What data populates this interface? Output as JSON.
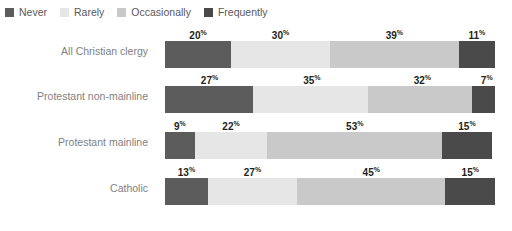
{
  "legend": {
    "position": "top-left",
    "items": [
      {
        "label": "Never",
        "color": "#5c5c5c",
        "icon": "legend-swatch-icon"
      },
      {
        "label": "Rarely",
        "color": "#e6e6e6",
        "icon": "legend-swatch-icon"
      },
      {
        "label": "Occasionally",
        "color": "#c9c9c9",
        "icon": "legend-swatch-icon"
      },
      {
        "label": "Frequently",
        "color": "#4a4a4a",
        "icon": "legend-swatch-icon"
      }
    ]
  },
  "chart_data": {
    "type": "bar",
    "orientation": "horizontal",
    "stacked": true,
    "normalized": "100%",
    "title": "",
    "subtitle": "",
    "xlabel": "",
    "ylabel": "",
    "xlim": [
      0,
      100
    ],
    "grid": false,
    "legend_position": "top-left",
    "value_suffix": "%",
    "categories": [
      "All Christian clergy",
      "Protestant non-mainline",
      "Protestant mainline",
      "Catholic"
    ],
    "series": [
      {
        "name": "Never",
        "color": "#5c5c5c",
        "values": [
          20,
          27,
          9,
          13
        ]
      },
      {
        "name": "Rarely",
        "color": "#e6e6e6",
        "values": [
          30,
          35,
          22,
          27
        ]
      },
      {
        "name": "Occasionally",
        "color": "#c9c9c9",
        "values": [
          39,
          32,
          53,
          45
        ]
      },
      {
        "name": "Frequently",
        "color": "#4a4a4a",
        "values": [
          11,
          7,
          15,
          15
        ]
      }
    ],
    "rows": [
      {
        "category": "All Christian clergy",
        "segments": [
          {
            "name": "Never",
            "value": 20,
            "label": "20",
            "suffix": "%",
            "color": "#5c5c5c"
          },
          {
            "name": "Rarely",
            "value": 30,
            "label": "30",
            "suffix": "%",
            "color": "#e6e6e6"
          },
          {
            "name": "Occasionally",
            "value": 39,
            "label": "39",
            "suffix": "%",
            "color": "#c9c9c9"
          },
          {
            "name": "Frequently",
            "value": 11,
            "label": "11",
            "suffix": "%",
            "color": "#4a4a4a"
          }
        ]
      },
      {
        "category": "Protestant non-mainline",
        "segments": [
          {
            "name": "Never",
            "value": 27,
            "label": "27",
            "suffix": "%",
            "color": "#5c5c5c"
          },
          {
            "name": "Rarely",
            "value": 35,
            "label": "35",
            "suffix": "%",
            "color": "#e6e6e6"
          },
          {
            "name": "Occasionally",
            "value": 32,
            "label": "32",
            "suffix": "%",
            "color": "#c9c9c9"
          },
          {
            "name": "Frequently",
            "value": 7,
            "label": "7",
            "suffix": "%",
            "color": "#4a4a4a"
          }
        ]
      },
      {
        "category": "Protestant mainline",
        "segments": [
          {
            "name": "Never",
            "value": 9,
            "label": "9",
            "suffix": "%",
            "color": "#5c5c5c"
          },
          {
            "name": "Rarely",
            "value": 22,
            "label": "22",
            "suffix": "%",
            "color": "#e6e6e6"
          },
          {
            "name": "Occasionally",
            "value": 53,
            "label": "53",
            "suffix": "%",
            "color": "#c9c9c9"
          },
          {
            "name": "Frequently",
            "value": 15,
            "label": "15",
            "suffix": "%",
            "color": "#4a4a4a"
          }
        ]
      },
      {
        "category": "Catholic",
        "segments": [
          {
            "name": "Never",
            "value": 13,
            "label": "13",
            "suffix": "%",
            "color": "#5c5c5c"
          },
          {
            "name": "Rarely",
            "value": 27,
            "label": "27",
            "suffix": "%",
            "color": "#e6e6e6"
          },
          {
            "name": "Occasionally",
            "value": 45,
            "label": "45",
            "suffix": "%",
            "color": "#c9c9c9"
          },
          {
            "name": "Frequently",
            "value": 15,
            "label": "15",
            "suffix": "%",
            "color": "#4a4a4a"
          }
        ]
      }
    ]
  },
  "colors": {
    "background": "#ffffff",
    "category_label": "#808184",
    "legend_label": "#58595b",
    "data_label": "#231f20"
  }
}
